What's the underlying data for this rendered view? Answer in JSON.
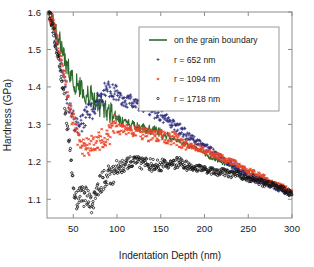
{
  "figure": {
    "background": "#ffffff",
    "frame_color": "#8c8c8c"
  },
  "chart_data": {
    "type": "scatter",
    "title": "",
    "xlabel": "Indentation Depth (nm)",
    "ylabel": "Hardness (GPa)",
    "xlim": [
      20,
      300
    ],
    "ylim": [
      1.05,
      1.6
    ],
    "xticks": [
      50,
      100,
      150,
      200,
      250,
      300
    ],
    "yticks": [
      1.1,
      1.2,
      1.3,
      1.4,
      1.5,
      1.6
    ],
    "xtick_labels": [
      "50",
      "100",
      "150",
      "200",
      "250",
      "300"
    ],
    "ytick_labels": [
      "1.1",
      "1.2",
      "1.3",
      "1.4",
      "1.5",
      "1.6"
    ],
    "grid": false,
    "legend_position": "upper right",
    "series": [
      {
        "name": "on the grain boundary",
        "color": "#2d6a2d",
        "marker": "line",
        "style": "solid-line",
        "x": [
          22,
          24,
          26,
          28,
          30,
          32,
          34,
          36,
          38,
          40,
          42,
          44,
          46,
          48,
          50,
          52,
          54,
          56,
          58,
          60,
          62,
          64,
          66,
          68,
          70,
          72,
          74,
          76,
          78,
          80,
          82,
          84,
          86,
          88,
          90,
          92,
          94,
          96,
          98,
          100,
          104,
          108,
          112,
          116,
          120,
          124,
          128,
          132,
          136,
          140,
          145,
          150,
          155,
          160,
          165,
          170,
          175,
          180,
          185,
          190,
          195,
          200,
          205,
          210,
          215,
          220,
          225,
          230,
          235,
          240,
          245,
          250,
          255,
          260,
          265,
          270,
          275,
          280,
          285,
          290,
          295,
          300
        ],
        "y": [
          1.6,
          1.59,
          1.58,
          1.57,
          1.55,
          1.54,
          1.53,
          1.51,
          1.5,
          1.48,
          1.46,
          1.45,
          1.44,
          1.42,
          1.425,
          1.4,
          1.415,
          1.395,
          1.405,
          1.385,
          1.4,
          1.375,
          1.39,
          1.37,
          1.385,
          1.365,
          1.375,
          1.355,
          1.365,
          1.345,
          1.355,
          1.34,
          1.35,
          1.335,
          1.345,
          1.325,
          1.335,
          1.315,
          1.325,
          1.31,
          1.315,
          1.3,
          1.305,
          1.295,
          1.3,
          1.29,
          1.295,
          1.285,
          1.29,
          1.28,
          1.285,
          1.275,
          1.27,
          1.265,
          1.26,
          1.255,
          1.25,
          1.245,
          1.24,
          1.235,
          1.23,
          1.225,
          1.215,
          1.21,
          1.205,
          1.2,
          1.195,
          1.19,
          1.185,
          1.18,
          1.175,
          1.17,
          1.165,
          1.16,
          1.155,
          1.15,
          1.145,
          1.14,
          1.135,
          1.13,
          1.12,
          1.115
        ]
      },
      {
        "name": "r = 652 nm",
        "color": "#2b2b7a",
        "marker": "plus",
        "style": "markers",
        "x": [
          22,
          24,
          26,
          28,
          30,
          32,
          34,
          36,
          38,
          40,
          42,
          44,
          46,
          48,
          50,
          52,
          54,
          56,
          58,
          60,
          62,
          64,
          66,
          68,
          70,
          72,
          74,
          76,
          78,
          80,
          82,
          84,
          86,
          88,
          90,
          92,
          94,
          96,
          98,
          100,
          104,
          108,
          112,
          116,
          120,
          124,
          128,
          132,
          136,
          140,
          145,
          150,
          155,
          160,
          165,
          170,
          175,
          180,
          185,
          190,
          195,
          200,
          205,
          210,
          215,
          220,
          225,
          230,
          235,
          240,
          245,
          250,
          255,
          260,
          265,
          270,
          275,
          280,
          285,
          290,
          295,
          300
        ],
        "y": [
          1.6,
          1.585,
          1.57,
          1.545,
          1.52,
          1.5,
          1.48,
          1.455,
          1.43,
          1.405,
          1.385,
          1.36,
          1.345,
          1.33,
          1.315,
          1.3,
          1.295,
          1.29,
          1.3,
          1.305,
          1.315,
          1.32,
          1.33,
          1.335,
          1.345,
          1.34,
          1.35,
          1.355,
          1.36,
          1.365,
          1.37,
          1.375,
          1.385,
          1.39,
          1.395,
          1.39,
          1.385,
          1.39,
          1.38,
          1.375,
          1.37,
          1.365,
          1.36,
          1.365,
          1.355,
          1.35,
          1.355,
          1.345,
          1.34,
          1.335,
          1.33,
          1.325,
          1.315,
          1.305,
          1.3,
          1.29,
          1.28,
          1.27,
          1.265,
          1.255,
          1.25,
          1.24,
          1.235,
          1.225,
          1.215,
          1.21,
          1.2,
          1.195,
          1.185,
          1.18,
          1.17,
          1.165,
          1.16,
          1.155,
          1.15,
          1.145,
          1.14,
          1.135,
          1.13,
          1.125,
          1.12,
          1.115
        ]
      },
      {
        "name": "r = 1094 nm",
        "color": "#e8452a",
        "marker": "asterisk",
        "style": "markers",
        "x": [
          22,
          24,
          26,
          28,
          30,
          32,
          34,
          36,
          38,
          40,
          42,
          44,
          46,
          48,
          50,
          52,
          54,
          56,
          58,
          60,
          62,
          64,
          66,
          68,
          70,
          72,
          74,
          76,
          78,
          80,
          82,
          84,
          86,
          88,
          90,
          92,
          94,
          96,
          98,
          100,
          104,
          108,
          112,
          116,
          120,
          124,
          128,
          132,
          136,
          140,
          145,
          150,
          155,
          160,
          165,
          170,
          175,
          180,
          185,
          190,
          195,
          200,
          205,
          210,
          215,
          220,
          225,
          230,
          235,
          240,
          245,
          250,
          255,
          260,
          265,
          270,
          275,
          280,
          285,
          290,
          295,
          300
        ],
        "y": [
          1.6,
          1.59,
          1.575,
          1.56,
          1.545,
          1.52,
          1.5,
          1.475,
          1.45,
          1.425,
          1.4,
          1.375,
          1.35,
          1.33,
          1.31,
          1.29,
          1.275,
          1.265,
          1.255,
          1.245,
          1.24,
          1.235,
          1.245,
          1.24,
          1.25,
          1.245,
          1.255,
          1.25,
          1.26,
          1.255,
          1.265,
          1.26,
          1.27,
          1.265,
          1.275,
          1.27,
          1.285,
          1.295,
          1.305,
          1.29,
          1.285,
          1.295,
          1.285,
          1.29,
          1.28,
          1.285,
          1.275,
          1.28,
          1.27,
          1.275,
          1.265,
          1.27,
          1.265,
          1.26,
          1.265,
          1.255,
          1.25,
          1.245,
          1.245,
          1.24,
          1.235,
          1.23,
          1.225,
          1.22,
          1.215,
          1.21,
          1.205,
          1.2,
          1.195,
          1.19,
          1.18,
          1.175,
          1.17,
          1.165,
          1.16,
          1.155,
          1.15,
          1.14,
          1.135,
          1.13,
          1.125,
          1.115
        ]
      },
      {
        "name": "r = 1718 nm",
        "color": "#111111",
        "marker": "circle",
        "style": "markers",
        "x": [
          22,
          24,
          26,
          28,
          30,
          32,
          34,
          36,
          38,
          40,
          42,
          44,
          46,
          48,
          50,
          52,
          54,
          56,
          58,
          60,
          62,
          64,
          66,
          68,
          70,
          72,
          74,
          76,
          78,
          80,
          82,
          84,
          86,
          88,
          90,
          92,
          94,
          96,
          98,
          100,
          104,
          108,
          112,
          116,
          120,
          124,
          128,
          132,
          136,
          140,
          145,
          150,
          155,
          160,
          165,
          170,
          175,
          180,
          185,
          190,
          195,
          200,
          205,
          210,
          215,
          220,
          225,
          230,
          235,
          240,
          245,
          250,
          255,
          260,
          265,
          270,
          275,
          280,
          285,
          290,
          295,
          300
        ],
        "y": [
          1.6,
          1.585,
          1.565,
          1.545,
          1.515,
          1.49,
          1.46,
          1.43,
          1.395,
          1.355,
          1.315,
          1.275,
          1.235,
          1.195,
          1.145,
          1.105,
          1.095,
          1.11,
          1.105,
          1.115,
          1.1,
          1.115,
          1.095,
          1.105,
          1.085,
          1.09,
          1.105,
          1.12,
          1.13,
          1.14,
          1.145,
          1.15,
          1.155,
          1.16,
          1.165,
          1.17,
          1.16,
          1.165,
          1.175,
          1.18,
          1.185,
          1.19,
          1.195,
          1.2,
          1.205,
          1.2,
          1.195,
          1.2,
          1.195,
          1.19,
          1.195,
          1.19,
          1.195,
          1.19,
          1.195,
          1.2,
          1.195,
          1.19,
          1.185,
          1.18,
          1.185,
          1.18,
          1.175,
          1.175,
          1.17,
          1.175,
          1.17,
          1.165,
          1.17,
          1.165,
          1.16,
          1.155,
          1.155,
          1.15,
          1.145,
          1.14,
          1.14,
          1.135,
          1.13,
          1.125,
          1.12,
          1.115
        ]
      }
    ]
  },
  "legend": {
    "entries": [
      {
        "label": "on the grain boundary",
        "color": "#2d6a2d",
        "marker": "line"
      },
      {
        "label": "r = 652 nm",
        "color": "#2b2b7a",
        "marker": "plus"
      },
      {
        "label": "r = 1094 nm",
        "color": "#e8452a",
        "marker": "asterisk"
      },
      {
        "label": "r = 1718 nm",
        "color": "#111111",
        "marker": "circle"
      }
    ]
  }
}
